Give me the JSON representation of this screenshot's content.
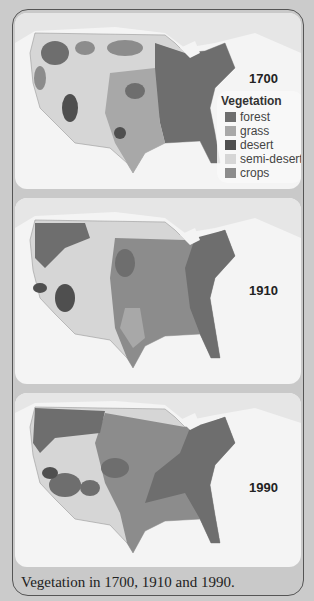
{
  "figure": {
    "caption": "Vegetation in 1700, 1910 and 1990.",
    "panels": [
      {
        "year": "1700"
      },
      {
        "year": "1910"
      },
      {
        "year": "1990"
      }
    ]
  },
  "legend": {
    "title": "Vegetation",
    "items": [
      {
        "label": "forest",
        "color": "#6e6e6e"
      },
      {
        "label": "grass",
        "color": "#a8a8a8"
      },
      {
        "label": "desert",
        "color": "#4f4f4f"
      },
      {
        "label": "semi-desert",
        "color": "#d6d6d6"
      },
      {
        "label": "crops",
        "color": "#8c8c8c"
      }
    ]
  },
  "colors": {
    "background": "#cbcbcb",
    "panel": "#f4f4f4",
    "water_land_outline": "#b9b9b9",
    "forest": "#6e6e6e",
    "grass": "#a8a8a8",
    "desert": "#4f4f4f",
    "semi_desert": "#d6d6d6",
    "crops": "#8c8c8c"
  }
}
